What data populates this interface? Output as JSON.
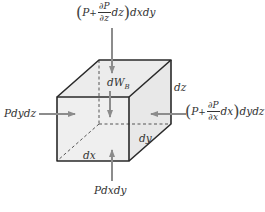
{
  "diagram": {
    "colors": {
      "face": "#ececec",
      "face_side": "#e6e6e6",
      "edge": "#2a2a2a",
      "hidden_edge": "#555555",
      "arrow": "#8c8c8c",
      "text": "#333333"
    },
    "cube": {
      "front_top_left": [
        57,
        97
      ],
      "front_top_right": [
        129,
        97
      ],
      "front_bottom_right": [
        129,
        161
      ],
      "front_bottom_left": [
        57,
        161
      ],
      "back_top_left": [
        99,
        60
      ],
      "back_top_right": [
        171,
        60
      ],
      "back_bottom_right": [
        171,
        124
      ],
      "back_bottom_left_hidden": [
        99,
        124
      ]
    },
    "labels": {
      "top_force": {
        "prefix": "P",
        "plus": "+",
        "frac_num": "∂P",
        "frac_den": "∂z",
        "mid": "dz",
        "suffix": "dxdy"
      },
      "right_force": {
        "prefix": "P",
        "plus": "+",
        "frac_num": "∂P",
        "frac_den": "∂x",
        "mid": "dx",
        "suffix": "dydz"
      },
      "left_force": "Pdydz",
      "bottom_force": "Pdxdy",
      "body_force": "dW",
      "body_force_sub": "B",
      "dim_dz": "dz",
      "dim_dy": "dy",
      "dim_dx": "dx"
    },
    "arrows": [
      {
        "name": "top-force-arrow",
        "from": [
          112,
          28
        ],
        "to": [
          112,
          73
        ]
      },
      {
        "name": "body-force-arrow",
        "from": [
          110,
          91
        ],
        "to": [
          110,
          117
        ]
      },
      {
        "name": "bottom-force-arrow",
        "from": [
          112,
          181
        ],
        "to": [
          112,
          150
        ]
      },
      {
        "name": "left-force-arrow",
        "from": [
          39,
          114
        ],
        "to": [
          75,
          114
        ]
      },
      {
        "name": "right-force-arrow",
        "from": [
          186,
          114
        ],
        "to": [
          151,
          114
        ]
      }
    ]
  }
}
